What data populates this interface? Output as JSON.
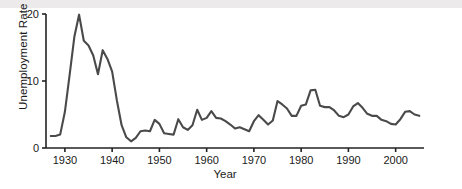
{
  "chart_data": {
    "type": "line",
    "title": "",
    "xlabel": "Year",
    "ylabel": "Unemployment Rate (%)",
    "xlim": [
      1926,
      2006
    ],
    "ylim": [
      0,
      20
    ],
    "xticks": [
      1930,
      1940,
      1950,
      1960,
      1970,
      1980,
      1990,
      2000
    ],
    "yticks": [
      0,
      10,
      20
    ],
    "grid": false,
    "legend": null,
    "line_color": "#4a4a4a",
    "axis_color": "#222222",
    "series": [
      {
        "name": "Unemployment Rate",
        "x": [
          1927,
          1928,
          1929,
          1930,
          1931,
          1932,
          1933,
          1934,
          1935,
          1936,
          1937,
          1938,
          1939,
          1940,
          1941,
          1942,
          1943,
          1944,
          1945,
          1946,
          1947,
          1948,
          1949,
          1950,
          1951,
          1952,
          1953,
          1954,
          1955,
          1956,
          1957,
          1958,
          1959,
          1960,
          1961,
          1962,
          1963,
          1964,
          1965,
          1966,
          1967,
          1968,
          1969,
          1970,
          1971,
          1972,
          1973,
          1974,
          1975,
          1976,
          1977,
          1978,
          1979,
          1980,
          1981,
          1982,
          1983,
          1984,
          1985,
          1986,
          1987,
          1988,
          1989,
          1990,
          1991,
          1992,
          1993,
          1994,
          1995,
          1996,
          1997,
          1998,
          1999,
          2000,
          2001,
          2002,
          2003,
          2004,
          2005
        ],
        "y": [
          1.8,
          1.8,
          2.0,
          5.4,
          10.9,
          16.6,
          19.9,
          16.0,
          15.3,
          13.8,
          11.0,
          14.6,
          13.3,
          11.4,
          7.1,
          3.4,
          1.6,
          1.0,
          1.5,
          2.5,
          2.6,
          2.5,
          4.2,
          3.6,
          2.2,
          2.1,
          2.0,
          4.3,
          3.1,
          2.7,
          3.4,
          5.7,
          4.2,
          4.5,
          5.5,
          4.5,
          4.4,
          4.0,
          3.5,
          2.9,
          3.1,
          2.8,
          2.5,
          4.0,
          4.9,
          4.2,
          3.5,
          4.1,
          7.0,
          6.5,
          5.9,
          4.8,
          4.8,
          6.3,
          6.5,
          8.6,
          8.7,
          6.3,
          6.1,
          6.1,
          5.6,
          4.8,
          4.6,
          5.0,
          6.2,
          6.7,
          6.0,
          5.1,
          4.8,
          4.8,
          4.2,
          4.0,
          3.6,
          3.5,
          4.3,
          5.4,
          5.5,
          5.0,
          4.8
        ]
      }
    ]
  },
  "axis": {
    "ylabel_text": "Unemployment Rate (%)",
    "xlabel_text": "Year",
    "ytick_labels": [
      "0",
      "10",
      "20"
    ],
    "xtick_labels": [
      "1930",
      "1940",
      "1950",
      "1960",
      "1970",
      "1980",
      "1990",
      "2000"
    ]
  }
}
